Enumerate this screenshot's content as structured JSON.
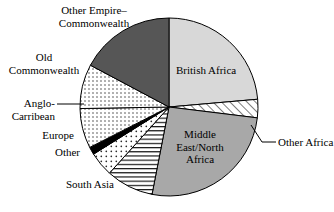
{
  "chart_data": {
    "type": "pie",
    "title": "",
    "subtitle": "",
    "xlabel": "",
    "ylabel": "",
    "legend_position": "none",
    "grid": false,
    "start_angle_deg": 0,
    "direction": "clockwise",
    "center": {
      "x": 169,
      "y": 107
    },
    "radius": 89,
    "labels": [
      "British Africa",
      "Other Africa",
      "Middle East/North Africa",
      "South Asia",
      "Other",
      "Europe",
      "Anglo-Carribean",
      "Old Commonwealth",
      "Other Empire–Commonwealth"
    ],
    "categories": [
      "British Africa",
      "Other Africa",
      "Middle East/North Africa",
      "South Asia",
      "Other",
      "Europe",
      "Anglo-Carribean",
      "Old Commonwealth",
      "Other Empire–Commonwealth"
    ],
    "values": [
      23.6,
      3.3,
      26.1,
      8.6,
      4.4,
      1.4,
      7.2,
      8.1,
      17.3
    ],
    "slices": [
      {
        "label": "British Africa",
        "value": 23.6,
        "start_deg": 0,
        "end_deg": 85,
        "fill": "light-gray-solid",
        "fill_color": "#d8d8d8"
      },
      {
        "label": "Other Africa",
        "value": 3.3,
        "start_deg": 85,
        "end_deg": 97,
        "fill": "diagonal-hatch",
        "fill_color": "#ffffff"
      },
      {
        "label": "Middle East/North Africa",
        "value": 26.1,
        "start_deg": 97,
        "end_deg": 191,
        "fill": "mid-gray-solid",
        "fill_color": "#a8a8a8"
      },
      {
        "label": "South Asia",
        "value": 8.6,
        "start_deg": 191,
        "end_deg": 222,
        "fill": "horizontal-lines",
        "fill_color": "#ffffff"
      },
      {
        "label": "Other",
        "value": 4.4,
        "start_deg": 222,
        "end_deg": 238,
        "fill": "sparse-dots",
        "fill_color": "#ffffff"
      },
      {
        "label": "Europe",
        "value": 1.4,
        "start_deg": 238,
        "end_deg": 243,
        "fill": "black-solid",
        "fill_color": "#000000"
      },
      {
        "label": "Anglo-Carribean",
        "value": 7.2,
        "start_deg": 243,
        "end_deg": 269,
        "fill": "fine-dots",
        "fill_color": "#ffffff"
      },
      {
        "label": "Old Commonwealth",
        "value": 8.1,
        "start_deg": 269,
        "end_deg": 298,
        "fill": "fine-dots",
        "fill_color": "#ffffff"
      },
      {
        "label": "Other Empire–Commonwealth",
        "value": 17.3,
        "start_deg": 298,
        "end_deg": 360,
        "fill": "dark-gray-solid",
        "fill_color": "#565656"
      }
    ]
  },
  "labels": {
    "other_empire_line1": "Other Empire–",
    "other_empire_line2": "Commonwealth",
    "old_commonwealth_line1": "Old",
    "old_commonwealth_line2": "Commonwealth",
    "anglo_line1": "Anglo-",
    "anglo_line2": "Carribean",
    "europe": "Europe",
    "other": "Other",
    "south_asia": "South Asia",
    "british_africa": "British Africa",
    "other_africa": "Other Africa",
    "middle_east_line1": "Middle",
    "middle_east_line2": "East/North",
    "middle_east_line3": "Africa"
  },
  "colors": {
    "light_gray": "#d8d8d8",
    "mid_gray": "#a8a8a8",
    "dark_gray": "#565656",
    "black": "#000000",
    "white": "#ffffff",
    "outline": "#000000"
  }
}
